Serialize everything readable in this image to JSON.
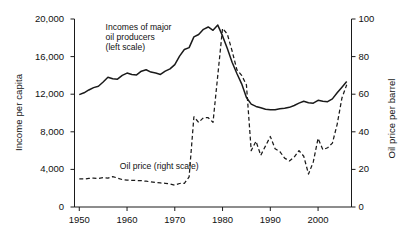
{
  "chart_data": {
    "type": "line",
    "title": "",
    "xlabel": "",
    "ylabel": "Income per capita",
    "y2label": "Oil price per barrel",
    "xlim": [
      1949,
      2007
    ],
    "ylim": [
      0,
      20000
    ],
    "y2lim": [
      0,
      100
    ],
    "grid": false,
    "legend_position": "inline-annotations",
    "x_ticks": [
      "1950",
      "1960",
      "1970",
      "1980",
      "1990",
      "2000"
    ],
    "x_tick_values": [
      1950,
      1960,
      1970,
      1980,
      1990,
      2000
    ],
    "y_ticks": [
      "0",
      "4,000",
      "8,000",
      "12,000",
      "16,000",
      "20,000"
    ],
    "y_tick_values": [
      0,
      4000,
      8000,
      12000,
      16000,
      20000
    ],
    "y2_ticks": [
      "0",
      "20",
      "40",
      "60",
      "80",
      "100"
    ],
    "y2_tick_values": [
      0,
      20,
      40,
      60,
      80,
      100
    ],
    "annotations": [
      {
        "name": "income-annotation",
        "text": "Incomes of major\noil producers\n(left scale)",
        "x": 1955.5,
        "y": 19200
      },
      {
        "name": "oil-price-annotation",
        "text": "Oil price (right scale)",
        "x": 1958.5,
        "y": 4350
      }
    ],
    "series": [
      {
        "name": "Incomes of major oil producers (left scale)",
        "axis": "left",
        "style": "solid",
        "color": "#1a1a1a",
        "x": [
          1950,
          1951,
          1952,
          1953,
          1954,
          1955,
          1956,
          1957,
          1958,
          1959,
          1960,
          1961,
          1962,
          1963,
          1964,
          1965,
          1966,
          1967,
          1968,
          1969,
          1970,
          1971,
          1972,
          1973,
          1974,
          1975,
          1976,
          1977,
          1978,
          1979,
          1980,
          1981,
          1982,
          1983,
          1984,
          1985,
          1986,
          1987,
          1988,
          1989,
          1990,
          1991,
          1992,
          1993,
          1994,
          1995,
          1996,
          1997,
          1998,
          1999,
          2000,
          2001,
          2002,
          2003,
          2004,
          2005,
          2006
        ],
        "values": [
          11950,
          12150,
          12450,
          12700,
          12850,
          13300,
          13800,
          13650,
          13600,
          14000,
          14250,
          14100,
          14050,
          14450,
          14600,
          14350,
          14250,
          14100,
          14450,
          14700,
          15150,
          16050,
          16750,
          16950,
          18100,
          18350,
          18900,
          19150,
          18800,
          19350,
          18200,
          16850,
          15400,
          14200,
          13100,
          11650,
          10950,
          10700,
          10550,
          10400,
          10350,
          10350,
          10450,
          10500,
          10600,
          10800,
          11050,
          11250,
          11100,
          11050,
          11350,
          11250,
          11200,
          11500,
          12150,
          12750,
          13350
        ]
      },
      {
        "name": "Oil price (right scale)",
        "axis": "right",
        "style": "dashed",
        "color": "#1a1a1a",
        "x": [
          1950,
          1951,
          1952,
          1953,
          1954,
          1955,
          1956,
          1957,
          1958,
          1959,
          1960,
          1961,
          1962,
          1963,
          1964,
          1965,
          1966,
          1967,
          1968,
          1969,
          1970,
          1971,
          1972,
          1973,
          1974,
          1975,
          1976,
          1977,
          1978,
          1979,
          1980,
          1981,
          1982,
          1983,
          1984,
          1985,
          1986,
          1987,
          1988,
          1989,
          1990,
          1991,
          1992,
          1993,
          1994,
          1995,
          1996,
          1997,
          1998,
          1999,
          2000,
          2001,
          2002,
          2003,
          2004,
          2005,
          2006
        ],
        "values": [
          15.0,
          14.9,
          15.2,
          15.4,
          15.2,
          15.6,
          15.4,
          16.2,
          15.4,
          14.6,
          14.3,
          14.2,
          14.1,
          14.0,
          13.7,
          13.4,
          13.0,
          12.8,
          12.6,
          12.3,
          11.6,
          12.5,
          12.6,
          16.0,
          48.0,
          45.0,
          47.5,
          47.5,
          45.0,
          70.0,
          95.0,
          92.0,
          83.0,
          73.0,
          70.0,
          65.0,
          30.0,
          35.0,
          27.5,
          32.5,
          37.5,
          31.0,
          29.5,
          26.0,
          24.5,
          26.5,
          30.0,
          27.0,
          17.5,
          24.0,
          36.5,
          30.5,
          31.5,
          34.0,
          44.0,
          58.0,
          65.0
        ]
      }
    ]
  }
}
